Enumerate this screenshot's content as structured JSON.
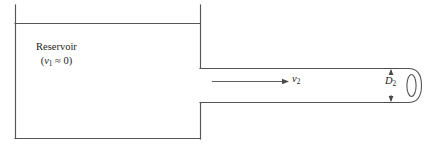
{
  "figure": {
    "type": "fluid-mechanics-schematic",
    "line_color": "#565656",
    "text_color": "#1d1d1d",
    "background_color": "#ffffff",
    "reservoir": {
      "name_label": "Reservoir",
      "velocity_symbol": "v",
      "velocity_subscript": "1",
      "velocity_relation": "≈ 0",
      "velocity_expression": "(v₁ ≈ 0)",
      "open_paren": "(",
      "close_paren": ")"
    },
    "pipe": {
      "flow_velocity_symbol": "v",
      "flow_velocity_subscript": "2",
      "diameter_symbol": "D",
      "diameter_subscript": "2"
    }
  }
}
